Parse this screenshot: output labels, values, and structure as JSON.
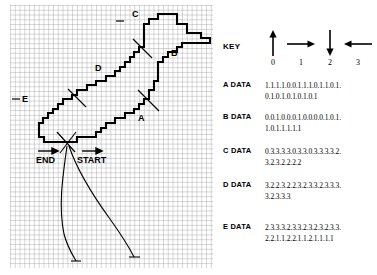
{
  "figure": {
    "grid": {
      "cell_px": 4.78,
      "cols": 42,
      "rows": 55,
      "line_color": "#8a8a8a",
      "outline_color": "#000000"
    },
    "segment_labels": [
      {
        "label": "A",
        "x": 138,
        "y": 118
      },
      {
        "label": "B",
        "x": 171,
        "y": 53
      },
      {
        "label": "C",
        "x": 132,
        "y": 14
      },
      {
        "label": "D",
        "x": 95,
        "y": 68
      },
      {
        "label": "E",
        "x": 21,
        "y": 99
      }
    ],
    "markers": {
      "start_label": "START",
      "end_label": "END"
    }
  },
  "key": {
    "label": "KEY",
    "items": [
      {
        "number": "0",
        "direction": "up",
        "icon": "arrow-up-icon"
      },
      {
        "number": "1",
        "direction": "right",
        "icon": "arrow-right-icon"
      },
      {
        "number": "2",
        "direction": "down",
        "icon": "arrow-down-icon"
      },
      {
        "number": "3",
        "direction": "left",
        "icon": "arrow-left-icon"
      }
    ]
  },
  "data_sets": [
    {
      "name": "A DATA",
      "lines": [
        "1.1.1.1.0.0.1.1.1.0.1.1.0.1.",
        "0.1.0.1.0.1.0.1.0.1"
      ]
    },
    {
      "name": "B DATA",
      "lines": [
        "0.0.1.0.0.0.1.0.0.0.0.1.0.1.",
        "1.0.1.1.1.1.1"
      ]
    },
    {
      "name": "C DATA",
      "lines": [
        "0.3.3.3.3.0.3.3.0.3.3.3.3.2.",
        "3.2.3.2.2.2.2"
      ]
    },
    {
      "name": "D DATA",
      "lines": [
        "3.2.2.3.2.2.3.2.3.3.2.3.3.3.",
        "3.2.3.3.3"
      ]
    },
    {
      "name": "E DATA",
      "lines": [
        "2.3.3.3.2.3.3.2.3.2.3.2.3.3.",
        "2.2.1.1.2.2.1.1.2.1.1.1.1"
      ]
    }
  ],
  "colors": {
    "ink": "#000000",
    "grid_line": "#8a8a8a",
    "background": "#ffffff"
  }
}
